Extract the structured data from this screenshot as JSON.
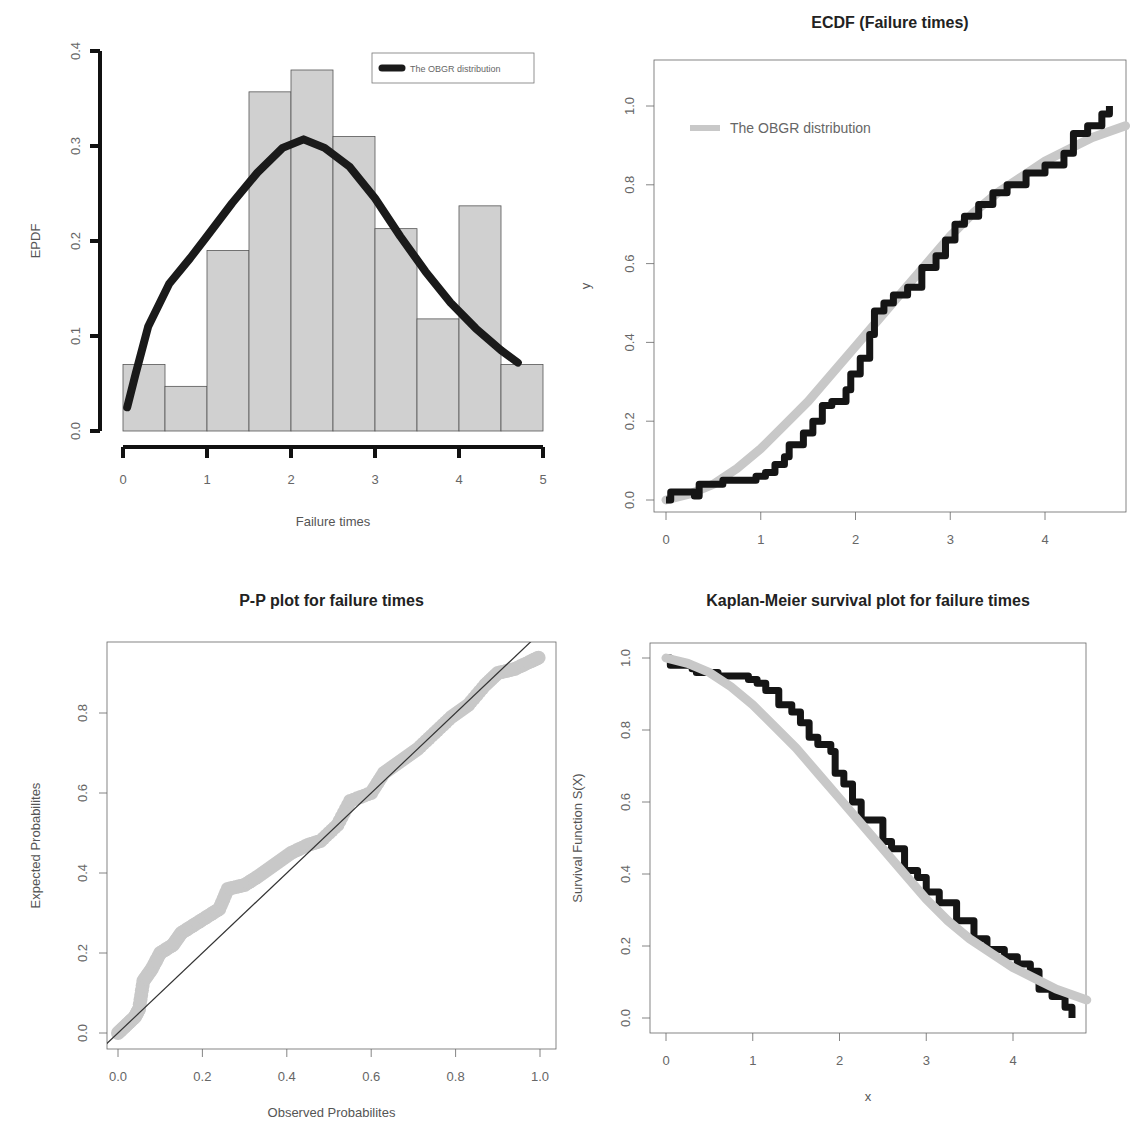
{
  "colors": {
    "bar_fill": "#d0d0d0",
    "bar_stroke": "#555555",
    "fit_curve_dark": "#1a1a1a",
    "fit_curve_light": "#c8c8c8",
    "empirical_dark": "#151515",
    "diagonal_line": "#333333"
  },
  "chart_data": [
    {
      "id": "histogram",
      "type": "bar",
      "title": "",
      "xlabel": "Failure times",
      "ylabel": "EPDF",
      "xlim": [
        0,
        5
      ],
      "ylim": [
        0,
        0.4
      ],
      "xticks": [
        "0",
        "1",
        "2",
        "3",
        "4",
        "5"
      ],
      "yticks": [
        "0.0",
        "0.1",
        "0.2",
        "0.3",
        "0.4"
      ],
      "bin_edges": [
        0,
        0.5,
        1,
        1.5,
        2,
        2.5,
        3,
        3.5,
        4,
        4.5,
        5
      ],
      "values": [
        0.07,
        0.047,
        0.19,
        0.357,
        0.38,
        0.31,
        0.213,
        0.118,
        0.237,
        0.07
      ],
      "legend": {
        "position": "top-right",
        "entries": [
          "The OBGR distribution"
        ]
      },
      "series": [
        {
          "name": "The OBGR distribution",
          "kind": "line",
          "x": [
            0.05,
            0.15,
            0.3,
            0.55,
            0.8,
            1.0,
            1.3,
            1.6,
            1.9,
            2.15,
            2.4,
            2.7,
            3.0,
            3.3,
            3.6,
            3.9,
            4.2,
            4.5,
            4.7
          ],
          "y": [
            0.025,
            0.06,
            0.11,
            0.155,
            0.182,
            0.205,
            0.24,
            0.272,
            0.298,
            0.307,
            0.298,
            0.278,
            0.245,
            0.205,
            0.168,
            0.135,
            0.108,
            0.085,
            0.072
          ]
        }
      ]
    },
    {
      "id": "ecdf",
      "type": "line",
      "title": "ECDF (Failure times)",
      "xlabel": "",
      "ylabel": "y",
      "xlim": [
        -0.1,
        4.85
      ],
      "ylim": [
        -0.04,
        1.04
      ],
      "xticks": [
        "0",
        "1",
        "2",
        "3",
        "4"
      ],
      "yticks": [
        "0.0",
        "0.2",
        "0.4",
        "0.6",
        "0.8",
        "1.0"
      ],
      "legend": {
        "position": "top-left",
        "entries": [
          "The OBGR distribution"
        ]
      },
      "series": [
        {
          "name": "Empirical CDF",
          "kind": "step",
          "x": [
            0,
            0.05,
            0.3,
            0.35,
            0.6,
            0.95,
            1.05,
            1.15,
            1.25,
            1.3,
            1.45,
            1.55,
            1.65,
            1.75,
            1.9,
            1.95,
            2.05,
            2.15,
            2.2,
            2.3,
            2.4,
            2.55,
            2.7,
            2.85,
            2.95,
            3.05,
            3.15,
            3.3,
            3.45,
            3.6,
            3.8,
            4.0,
            4.2,
            4.3,
            4.45,
            4.6,
            4.68
          ],
          "y": [
            0.0,
            0.02,
            0.01,
            0.04,
            0.05,
            0.06,
            0.07,
            0.09,
            0.11,
            0.14,
            0.17,
            0.2,
            0.24,
            0.25,
            0.28,
            0.32,
            0.36,
            0.42,
            0.48,
            0.5,
            0.52,
            0.54,
            0.59,
            0.62,
            0.66,
            0.7,
            0.72,
            0.75,
            0.78,
            0.8,
            0.83,
            0.85,
            0.88,
            0.93,
            0.95,
            0.98,
            1.0
          ]
        },
        {
          "name": "The OBGR distribution",
          "kind": "line",
          "x": [
            0,
            0.25,
            0.5,
            0.75,
            1.0,
            1.25,
            1.5,
            1.75,
            2.0,
            2.25,
            2.5,
            2.75,
            3.0,
            3.25,
            3.5,
            3.75,
            4.0,
            4.25,
            4.5,
            4.85
          ],
          "y": [
            0.0,
            0.015,
            0.04,
            0.08,
            0.13,
            0.19,
            0.25,
            0.32,
            0.39,
            0.46,
            0.53,
            0.6,
            0.67,
            0.73,
            0.78,
            0.82,
            0.86,
            0.89,
            0.92,
            0.95
          ]
        }
      ]
    },
    {
      "id": "pp_plot",
      "type": "scatter",
      "title": "P-P plot for failure times",
      "xlabel": "Observed Probabilites",
      "ylabel": "Expected Probabilites",
      "xlim": [
        -0.03,
        1.03
      ],
      "ylim": [
        -0.03,
        0.98
      ],
      "xticks": [
        "0.0",
        "0.2",
        "0.4",
        "0.6",
        "0.8",
        "1.0"
      ],
      "yticks": [
        "0.0",
        "0.2",
        "0.4",
        "0.6",
        "0.8"
      ],
      "series": [
        {
          "name": "Expected vs Observed",
          "kind": "points",
          "x": [
            0.0,
            0.02,
            0.04,
            0.05,
            0.06,
            0.08,
            0.1,
            0.13,
            0.15,
            0.18,
            0.21,
            0.24,
            0.26,
            0.3,
            0.33,
            0.37,
            0.41,
            0.45,
            0.48,
            0.52,
            0.55,
            0.6,
            0.63,
            0.67,
            0.71,
            0.75,
            0.79,
            0.83,
            0.87,
            0.9,
            0.94,
            0.98,
            1.0
          ],
          "y": [
            0.0,
            0.02,
            0.04,
            0.06,
            0.13,
            0.16,
            0.2,
            0.22,
            0.25,
            0.27,
            0.29,
            0.31,
            0.36,
            0.37,
            0.39,
            0.42,
            0.45,
            0.47,
            0.48,
            0.52,
            0.58,
            0.6,
            0.65,
            0.68,
            0.71,
            0.75,
            0.79,
            0.82,
            0.87,
            0.9,
            0.91,
            0.93,
            0.94
          ]
        },
        {
          "name": "Reference line y=x",
          "kind": "line",
          "x": [
            -0.03,
            1.03
          ],
          "y": [
            -0.03,
            1.03
          ]
        }
      ]
    },
    {
      "id": "kaplan_meier",
      "type": "line",
      "title": "Kaplan-Meier survival plot for failure times",
      "xlabel": "x",
      "ylabel": "Survival  Function S(X)",
      "xlim": [
        -0.1,
        4.85
      ],
      "ylim": [
        -0.04,
        1.04
      ],
      "xticks": [
        "0",
        "1",
        "2",
        "3",
        "4"
      ],
      "yticks": [
        "0.0",
        "0.2",
        "0.4",
        "0.6",
        "0.8",
        "1.0"
      ],
      "series": [
        {
          "name": "Kaplan-Meier estimate",
          "kind": "step",
          "x": [
            0,
            0.05,
            0.3,
            0.35,
            0.6,
            0.95,
            1.05,
            1.15,
            1.3,
            1.45,
            1.55,
            1.65,
            1.75,
            1.9,
            1.95,
            2.05,
            2.15,
            2.25,
            2.5,
            2.6,
            2.75,
            2.9,
            3.0,
            3.15,
            3.35,
            3.55,
            3.7,
            3.9,
            4.05,
            4.2,
            4.3,
            4.45,
            4.6,
            4.68
          ],
          "y": [
            1.0,
            0.98,
            0.97,
            0.96,
            0.95,
            0.94,
            0.93,
            0.91,
            0.87,
            0.85,
            0.82,
            0.78,
            0.76,
            0.74,
            0.68,
            0.65,
            0.6,
            0.55,
            0.49,
            0.47,
            0.41,
            0.39,
            0.35,
            0.32,
            0.27,
            0.22,
            0.19,
            0.17,
            0.15,
            0.13,
            0.08,
            0.06,
            0.03,
            0.0
          ]
        },
        {
          "name": "The OBGR distribution",
          "kind": "line",
          "x": [
            0,
            0.25,
            0.5,
            0.75,
            1.0,
            1.25,
            1.5,
            1.75,
            2.0,
            2.25,
            2.5,
            2.75,
            3.0,
            3.25,
            3.5,
            3.75,
            4.0,
            4.25,
            4.5,
            4.85
          ],
          "y": [
            1.0,
            0.985,
            0.96,
            0.92,
            0.87,
            0.81,
            0.75,
            0.68,
            0.61,
            0.54,
            0.47,
            0.4,
            0.33,
            0.27,
            0.22,
            0.18,
            0.14,
            0.11,
            0.08,
            0.05
          ]
        }
      ]
    }
  ]
}
